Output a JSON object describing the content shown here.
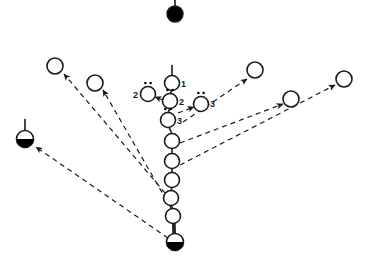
{
  "figure": {
    "canvas": {
      "width": 366,
      "height": 266
    },
    "colors": {
      "stroke": "#1a1a1a",
      "fill_open": "#ffffff",
      "fill_solid": "#000000",
      "background": "#ffffff"
    },
    "style": {
      "dash_pattern": "5,4",
      "stroke_width": 1.2,
      "node_radius": 7.5
    }
  },
  "nodes": [
    {
      "id": "top-solid",
      "type": "solid",
      "cx": 175,
      "cy": 14,
      "r": 8,
      "stem": "up",
      "stem_len": 10,
      "dots": false,
      "label": ""
    },
    {
      "id": "chain-1",
      "type": "open",
      "cx": 172,
      "cy": 83,
      "r": 7.5,
      "stem": "up",
      "stem_len": 10,
      "dots": false,
      "label": "1",
      "label_dx": 9,
      "label_dy": 4
    },
    {
      "id": "chain-2",
      "type": "open",
      "cx": 170,
      "cy": 101,
      "r": 7.5,
      "stem": "none",
      "stem_len": 0,
      "dots": true,
      "label": "2",
      "label_dx": 9,
      "label_dy": 4
    },
    {
      "id": "chain-3",
      "type": "open",
      "cx": 168,
      "cy": 120,
      "r": 7.5,
      "stem": "none",
      "stem_len": 0,
      "dots": true,
      "label": "3",
      "label_dx": 9,
      "label_dy": 4
    },
    {
      "id": "chain-4",
      "type": "open",
      "cx": 172,
      "cy": 141,
      "r": 7.5,
      "stem": "none",
      "stem_len": 0,
      "dots": false,
      "label": ""
    },
    {
      "id": "chain-5",
      "type": "open",
      "cx": 172,
      "cy": 161,
      "r": 7.5,
      "stem": "none",
      "stem_len": 0,
      "dots": false,
      "label": ""
    },
    {
      "id": "chain-6",
      "type": "open",
      "cx": 172,
      "cy": 180,
      "r": 7.5,
      "stem": "none",
      "stem_len": 0,
      "dots": false,
      "label": ""
    },
    {
      "id": "chain-7",
      "type": "open",
      "cx": 171,
      "cy": 198,
      "r": 7.5,
      "stem": "none",
      "stem_len": 0,
      "dots": false,
      "label": ""
    },
    {
      "id": "chain-8",
      "type": "open",
      "cx": 173,
      "cy": 216,
      "r": 7.5,
      "stem": "down",
      "stem_len": 10,
      "dots": false,
      "label": ""
    },
    {
      "id": "bottom-half",
      "type": "half",
      "cx": 175,
      "cy": 242,
      "r": 8.5,
      "stem": "up",
      "stem_len": 10,
      "dots": false,
      "label": ""
    },
    {
      "id": "branch-left-2",
      "type": "open",
      "cx": 148,
      "cy": 94,
      "r": 7.5,
      "stem": "none",
      "stem_len": 0,
      "dots": true,
      "label": "2",
      "label_dx": -15,
      "label_dy": 4
    },
    {
      "id": "branch-right-3",
      "type": "open",
      "cx": 201,
      "cy": 104,
      "r": 7.5,
      "stem": "none",
      "stem_len": 0,
      "dots": true,
      "label": "3",
      "label_dx": 9,
      "label_dy": 3
    },
    {
      "id": "outer-left-far",
      "type": "open",
      "cx": 55,
      "cy": 66,
      "r": 8,
      "stem": "none",
      "stem_len": 0,
      "dots": false,
      "label": ""
    },
    {
      "id": "outer-left-near",
      "type": "open",
      "cx": 95,
      "cy": 83,
      "r": 8,
      "stem": "none",
      "stem_len": 0,
      "dots": false,
      "label": ""
    },
    {
      "id": "outer-left-half",
      "type": "half",
      "cx": 25,
      "cy": 139,
      "r": 8.5,
      "stem": "up",
      "stem_len": 11,
      "dots": false,
      "label": ""
    },
    {
      "id": "outer-right-near",
      "type": "open",
      "cx": 255,
      "cy": 70,
      "r": 8,
      "stem": "none",
      "stem_len": 0,
      "dots": false,
      "label": ""
    },
    {
      "id": "outer-right-mid",
      "type": "open",
      "cx": 291,
      "cy": 99,
      "r": 8,
      "stem": "none",
      "stem_len": 0,
      "dots": false,
      "label": ""
    },
    {
      "id": "outer-right-far",
      "type": "open",
      "cx": 344,
      "cy": 79,
      "r": 8,
      "stem": "none",
      "stem_len": 0,
      "dots": false,
      "label": ""
    }
  ],
  "arrows": [
    {
      "id": "arrow-to-outer-left-far",
      "x1": 171,
      "y1": 200,
      "x2": 64,
      "y2": 74,
      "head": true
    },
    {
      "id": "arrow-to-outer-left-near",
      "x1": 171,
      "y1": 208,
      "x2": 103,
      "y2": 90,
      "head": true
    },
    {
      "id": "arrow-to-outer-left-half",
      "x1": 168,
      "y1": 238,
      "x2": 36,
      "y2": 147,
      "head": true
    },
    {
      "id": "arrow-to-outer-right-near",
      "x1": 183,
      "y1": 122,
      "x2": 247,
      "y2": 79,
      "head": true
    },
    {
      "id": "arrow-to-outer-right-mid",
      "x1": 180,
      "y1": 143,
      "x2": 283,
      "y2": 104,
      "head": true
    },
    {
      "id": "arrow-to-outer-right-far",
      "x1": 180,
      "y1": 165,
      "x2": 335,
      "y2": 85,
      "head": true
    },
    {
      "id": "arrow-to-branch-left-2",
      "x1": 163,
      "y1": 100,
      "x2": 155,
      "y2": 97,
      "head": true
    },
    {
      "id": "arrow-to-branch-right-3",
      "x1": 178,
      "y1": 113,
      "x2": 194,
      "y2": 107,
      "head": true
    }
  ],
  "chain_links": [
    {
      "id": "link-1-2",
      "x1": 172,
      "y1": 90,
      "x2": 170,
      "y2": 94
    },
    {
      "id": "link-2-3",
      "x1": 170,
      "y1": 108,
      "x2": 168,
      "y2": 113
    },
    {
      "id": "link-3-4",
      "x1": 169,
      "y1": 127,
      "x2": 172,
      "y2": 134
    },
    {
      "id": "link-4-5",
      "x1": 172,
      "y1": 148,
      "x2": 172,
      "y2": 154
    },
    {
      "id": "link-5-6",
      "x1": 172,
      "y1": 168,
      "x2": 172,
      "y2": 173
    },
    {
      "id": "link-6-7",
      "x1": 172,
      "y1": 187,
      "x2": 171,
      "y2": 191
    },
    {
      "id": "link-7-8",
      "x1": 171,
      "y1": 205,
      "x2": 173,
      "y2": 209
    },
    {
      "id": "link-8-bottom",
      "x1": 173,
      "y1": 223,
      "x2": 175,
      "y2": 234
    }
  ],
  "labels": {
    "one": "1",
    "two": "2",
    "three": "3"
  }
}
